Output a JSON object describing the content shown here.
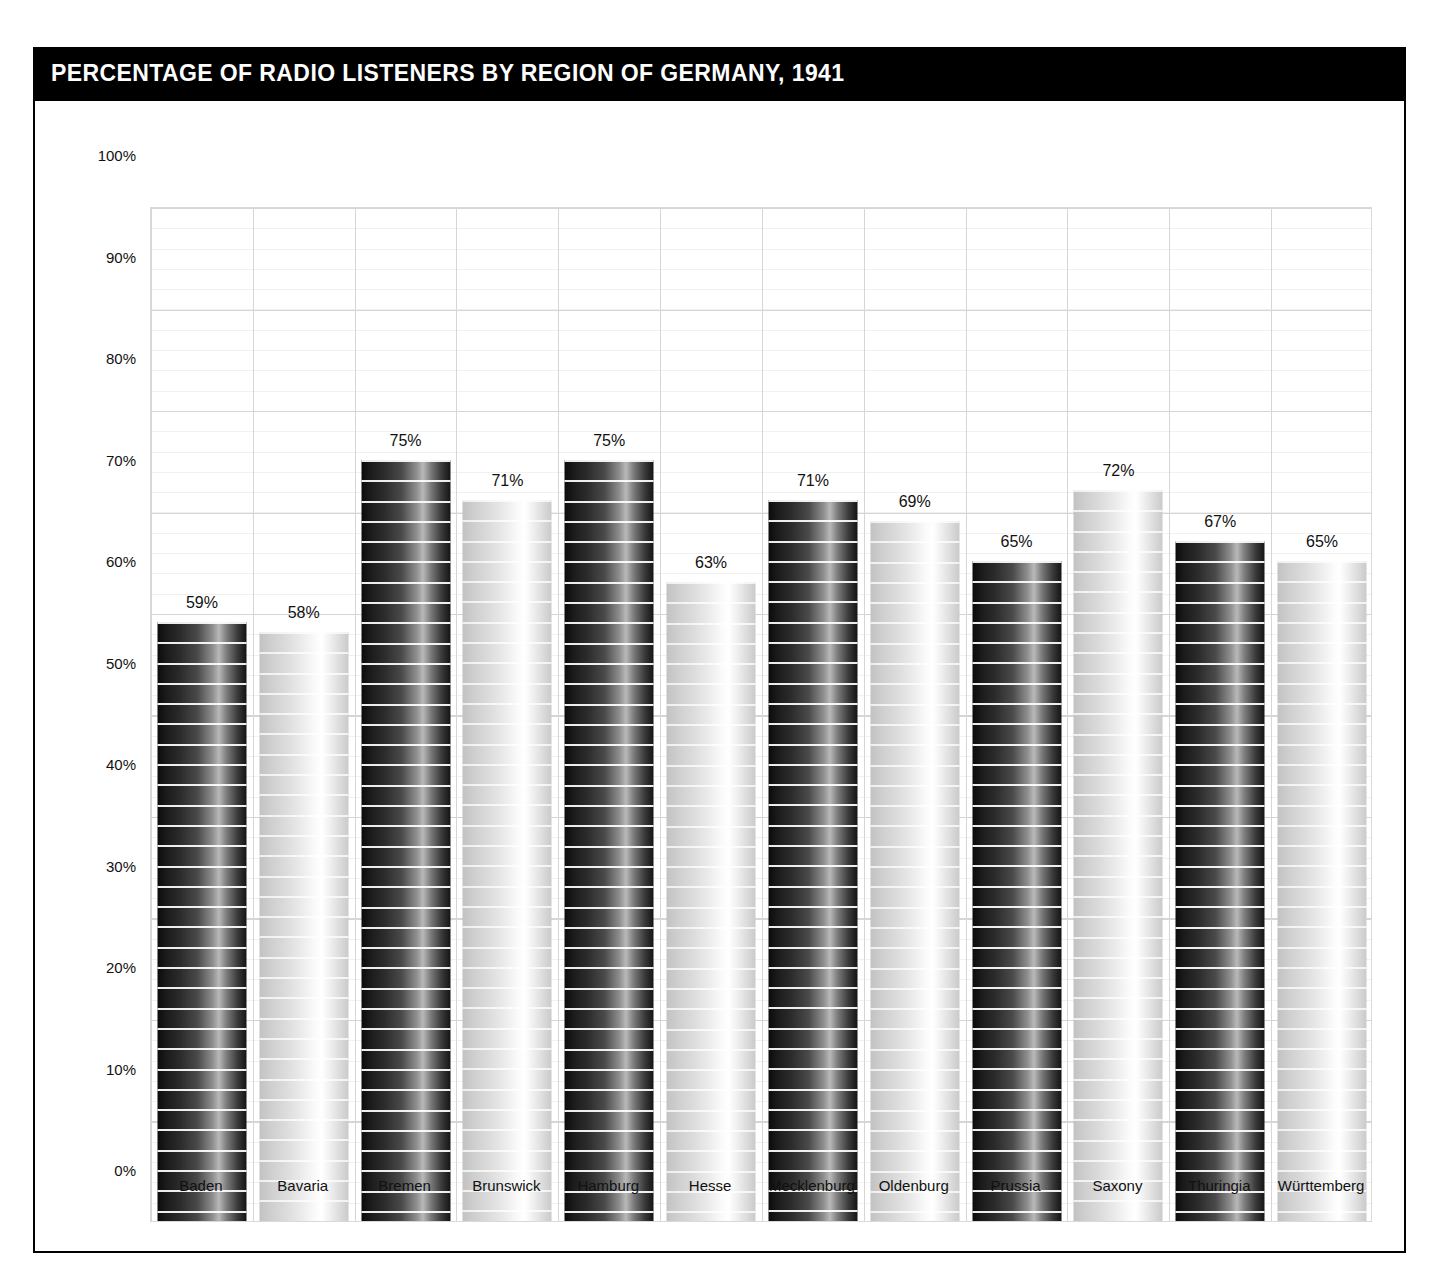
{
  "header": {
    "title": "PERCENTAGE OF RADIO LISTENERS BY REGION OF GERMANY, 1941",
    "background_color": "#000000",
    "text_color": "#ffffff"
  },
  "chart_data": {
    "type": "bar",
    "title": "PERCENTAGE OF RADIO LISTENERS BY REGION OF GERMANY, 1941",
    "xlabel": "",
    "ylabel": "",
    "ylim": [
      0,
      100
    ],
    "ytick_labels": [
      "100%",
      "90%",
      "80%",
      "70%",
      "60%",
      "50%",
      "40%",
      "30%",
      "20%",
      "10%",
      "0%"
    ],
    "ytick_values": [
      100,
      90,
      80,
      70,
      60,
      50,
      40,
      30,
      20,
      10,
      0
    ],
    "grid": {
      "major_horizontal_step": 10,
      "minor_horizontal_step": 2,
      "vertical_separators": true,
      "major_color": "#d6d6d6",
      "minor_color": "#f1f1f1"
    },
    "legend": null,
    "value_label_suffix": "%",
    "categories": [
      "Baden",
      "Bavaria",
      "Bremen",
      "Brunswick",
      "Hamburg",
      "Hesse",
      "Mecklenburg",
      "Oldenburg",
      "Prussia",
      "Saxony",
      "Thuringia",
      "Württemberg"
    ],
    "values": [
      59,
      58,
      75,
      71,
      75,
      63,
      71,
      69,
      65,
      72,
      67,
      65
    ],
    "value_labels": [
      "59%",
      "58%",
      "75%",
      "71%",
      "75%",
      "63%",
      "71%",
      "69%",
      "65%",
      "72%",
      "67%",
      "65%"
    ],
    "bar_styles": [
      "dark",
      "light",
      "dark",
      "light",
      "dark",
      "light",
      "dark",
      "light",
      "dark",
      "light",
      "dark",
      "light"
    ],
    "bars": [
      {
        "category": "Baden",
        "value": 59,
        "label": "59%",
        "style": "dark"
      },
      {
        "category": "Bavaria",
        "value": 58,
        "label": "58%",
        "style": "light"
      },
      {
        "category": "Bremen",
        "value": 75,
        "label": "75%",
        "style": "dark"
      },
      {
        "category": "Brunswick",
        "value": 71,
        "label": "71%",
        "style": "light"
      },
      {
        "category": "Hamburg",
        "value": 75,
        "label": "75%",
        "style": "dark"
      },
      {
        "category": "Hesse",
        "value": 63,
        "label": "63%",
        "style": "light"
      },
      {
        "category": "Mecklenburg",
        "value": 71,
        "label": "71%",
        "style": "dark"
      },
      {
        "category": "Oldenburg",
        "value": 69,
        "label": "69%",
        "style": "light"
      },
      {
        "category": "Prussia",
        "value": 65,
        "label": "65%",
        "style": "dark"
      },
      {
        "category": "Saxony",
        "value": 72,
        "label": "72%",
        "style": "light"
      },
      {
        "category": "Thuringia",
        "value": 67,
        "label": "67%",
        "style": "dark"
      },
      {
        "category": "Württemberg",
        "value": 65,
        "label": "65%",
        "style": "light"
      }
    ]
  }
}
